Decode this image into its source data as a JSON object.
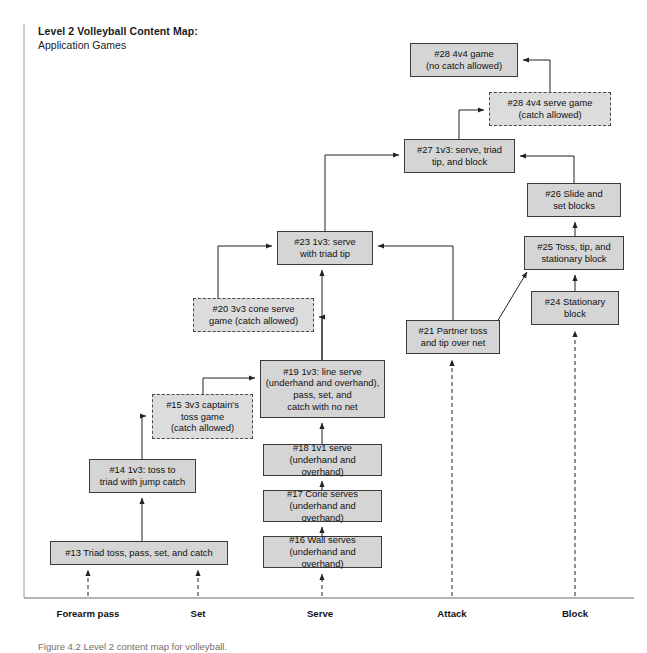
{
  "title": {
    "line1": "Level 2 Volleyball Content Map:",
    "line2": "Application Games"
  },
  "caption": "Figure 4.2  Level 2 content map for volleyball.",
  "colors": {
    "node_fill": "#d5d5d5",
    "node_fill_dashed": "#dcdcdc",
    "node_border": "#3a3a3a",
    "axis": "#555555",
    "background": "#ffffff"
  },
  "axis": {
    "name": "skill-progression-axis",
    "labels": [
      {
        "text": "Forearm pass",
        "x": 88
      },
      {
        "text": "Set",
        "x": 198
      },
      {
        "text": "Serve",
        "x": 320
      },
      {
        "text": "Attack",
        "x": 452
      },
      {
        "text": "Block",
        "x": 575
      }
    ]
  },
  "nodes": [
    {
      "id": "n28game",
      "label": "#28 4v4 game\n(no catch allowed)",
      "x": 410,
      "y": 43,
      "w": 108,
      "h": 34,
      "style": "solid"
    },
    {
      "id": "n28serve",
      "label": "#28 4v4 serve game\n(catch allowed)",
      "x": 489,
      "y": 92,
      "w": 122,
      "h": 34,
      "style": "dashed"
    },
    {
      "id": "n27",
      "label": "#27 1v3: serve, triad\ntip, and block",
      "x": 404,
      "y": 139,
      "w": 111,
      "h": 34,
      "style": "solid"
    },
    {
      "id": "n26",
      "label": "#26 Slide and\nset blocks",
      "x": 527,
      "y": 183,
      "w": 94,
      "h": 34,
      "style": "solid"
    },
    {
      "id": "n25",
      "label": "#25 Toss, tip, and\nstationary block",
      "x": 524,
      "y": 236,
      "w": 100,
      "h": 34,
      "style": "solid"
    },
    {
      "id": "n23",
      "label": "#23 1v3: serve\nwith triad tip",
      "x": 277,
      "y": 231,
      "w": 96,
      "h": 34,
      "style": "solid"
    },
    {
      "id": "n24",
      "label": "#24 Stationary\nblock",
      "x": 531,
      "y": 291,
      "w": 88,
      "h": 34,
      "style": "solid"
    },
    {
      "id": "n20",
      "label": "#20 3v3 cone serve\ngame (catch allowed)",
      "x": 193,
      "y": 298,
      "w": 121,
      "h": 34,
      "style": "dashed"
    },
    {
      "id": "n21",
      "label": "#21 Partner toss\nand tip over net",
      "x": 406,
      "y": 320,
      "w": 94,
      "h": 34,
      "style": "solid"
    },
    {
      "id": "n19",
      "label": "#19 1v3: line serve\n(underhand and overhand),\npass, set, and\ncatch with no net",
      "x": 260,
      "y": 360,
      "w": 125,
      "h": 58,
      "style": "solid"
    },
    {
      "id": "n15",
      "label": "#15 3v3 captain's\ntoss game\n(catch allowed)",
      "x": 152,
      "y": 394,
      "w": 101,
      "h": 45,
      "style": "dashed"
    },
    {
      "id": "n18",
      "label": "#18 1v1 serve\n(underhand and overhand)",
      "x": 263,
      "y": 444,
      "w": 119,
      "h": 32,
      "style": "solid"
    },
    {
      "id": "n14",
      "label": "#14 1v3: toss to\ntriad with jump catch",
      "x": 89,
      "y": 459,
      "w": 107,
      "h": 34,
      "style": "solid"
    },
    {
      "id": "n17",
      "label": "#17 Cone serves\n(underhand and overhand)",
      "x": 263,
      "y": 490,
      "w": 119,
      "h": 32,
      "style": "solid"
    },
    {
      "id": "n16",
      "label": "#16 Wall serves\n(underhand and overhand)",
      "x": 263,
      "y": 536,
      "w": 119,
      "h": 32,
      "style": "solid"
    },
    {
      "id": "n13",
      "label": "#13 Triad toss, pass, set, and catch",
      "x": 50,
      "y": 541,
      "w": 178,
      "h": 24,
      "style": "solid"
    }
  ],
  "edges": [
    {
      "from": "n28serve",
      "to": "n28game",
      "kind": "elbow-left",
      "style": "solid"
    },
    {
      "from": "n27",
      "to": "n28serve",
      "kind": "elbow-right",
      "style": "solid"
    },
    {
      "from": "n23",
      "to": "n27",
      "kind": "elbow-up",
      "style": "solid"
    },
    {
      "from": "n26",
      "to": "n27",
      "kind": "elbow-left",
      "style": "solid"
    },
    {
      "from": "n25",
      "to": "n26",
      "kind": "vertical",
      "style": "solid"
    },
    {
      "from": "n24",
      "to": "n25",
      "kind": "vertical",
      "style": "solid"
    },
    {
      "from": "n21",
      "to": "n25",
      "kind": "diagonal",
      "style": "solid"
    },
    {
      "from": "n21",
      "to": "n23",
      "kind": "elbow-left",
      "style": "solid"
    },
    {
      "from": "n20",
      "to": "n23",
      "kind": "elbow-up",
      "style": "solid"
    },
    {
      "from": "n19",
      "to": "n20",
      "kind": "elbow-left",
      "style": "solid"
    },
    {
      "from": "n19",
      "to": "n23",
      "kind": "vertical",
      "style": "solid"
    },
    {
      "from": "n15",
      "to": "n19",
      "kind": "elbow-right",
      "style": "solid"
    },
    {
      "from": "n14",
      "to": "n15",
      "kind": "elbow-up",
      "style": "solid"
    },
    {
      "from": "n13",
      "to": "n14",
      "kind": "vertical",
      "style": "solid"
    },
    {
      "from": "n18",
      "to": "n19",
      "kind": "vertical",
      "style": "solid"
    },
    {
      "from": "n17",
      "to": "n18",
      "kind": "vertical",
      "style": "solid"
    },
    {
      "from": "n16",
      "to": "n17",
      "kind": "vertical",
      "style": "solid"
    },
    {
      "from": "axis-forearm-a",
      "to": "n13",
      "kind": "vertical",
      "style": "dashed"
    },
    {
      "from": "axis-set",
      "to": "n13",
      "kind": "vertical",
      "style": "dashed"
    },
    {
      "from": "axis-serve",
      "to": "n16",
      "kind": "vertical",
      "style": "dashed"
    },
    {
      "from": "axis-attack",
      "to": "n21",
      "kind": "vertical",
      "style": "dashed"
    },
    {
      "from": "axis-block",
      "to": "n24",
      "kind": "vertical",
      "style": "dashed"
    }
  ]
}
